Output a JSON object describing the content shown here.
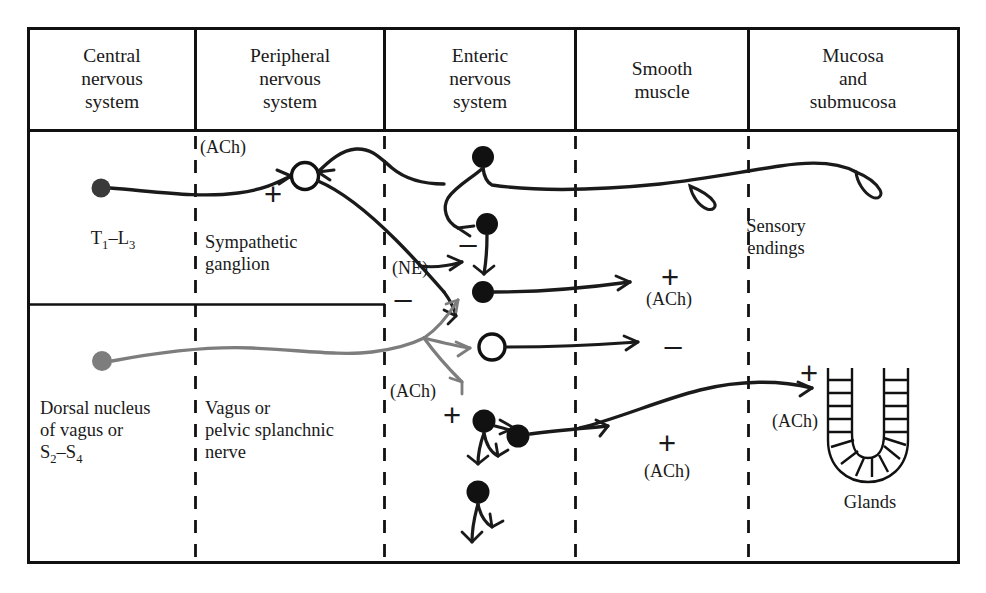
{
  "figure": {
    "type": "physiology-schematic",
    "frame_color": "#111111",
    "sympathetic_color": "#1a1a1a",
    "parasympathetic_color": "#7a7a7a"
  },
  "header": {
    "columns": [
      {
        "label": "Central\nnervous\nsystem",
        "lines": [
          "Central",
          "nervous",
          "system"
        ]
      },
      {
        "label": "Peripheral\nnervous\nsystem",
        "lines": [
          "Peripheral",
          "nervous",
          "system"
        ]
      },
      {
        "label": "Enteric\nnervous\nsystem",
        "lines": [
          "Enteric",
          "nervous",
          "system"
        ]
      },
      {
        "label": "Smooth\nmuscle",
        "lines": [
          "Smooth",
          "muscle"
        ]
      },
      {
        "label": "Mucosa\nand\nsubmucosa",
        "lines": [
          "Mucosa",
          "and",
          "submucosa"
        ]
      }
    ]
  },
  "labels": {
    "cns_sympathetic_line1": "T",
    "cns_sympathetic_sub1": "1",
    "cns_sympathetic_dash": "–L",
    "cns_sympathetic_sub2": "3",
    "sympathetic_ganglion": "Sympathetic\nganglion",
    "sympathetic_ganglion_l1": "Sympathetic",
    "sympathetic_ganglion_l2": "ganglion",
    "cns_parasympathetic_l1": "Dorsal nucleus",
    "cns_parasympathetic_l2": "of vagus or",
    "cns_parasympathetic_l3_a": "S",
    "cns_parasympathetic_l3_sub1": "2",
    "cns_parasympathetic_l3_b": "–S",
    "cns_parasympathetic_l3_sub2": "4",
    "pns_parasympathetic_l1": "Vagus or",
    "pns_parasympathetic_l2": "pelvic splanchnic",
    "pns_parasympathetic_l3": "nerve",
    "sensory_endings_l1": "Sensory",
    "sensory_endings_l2": "endings",
    "glands": "Glands"
  },
  "neurotransmitters": {
    "preganglionic_sympathetic": "(ACh)",
    "postganglionic_sympathetic": "(NE)",
    "preganglionic_parasympathetic": "(ACh)",
    "enteric_to_muscle": "(ACh)",
    "enteric_to_muscle_2": "(ACh)",
    "enteric_to_glands": "(ACh)"
  },
  "signs": {
    "ganglion_excitatory": "+",
    "ne_inhibitory_1": "–",
    "ne_inhibitory_2": "–",
    "ach_excitatory_upper": "+",
    "inhibitory_motor_neuron": "–",
    "vagal_excitatory": "+",
    "ach_excitatory_muscle": "+",
    "ach_excitatory_glands": "+"
  },
  "elements": {
    "filled_soma": "filled-cell-body",
    "open_soma": "open-cell-body",
    "gray_soma": "gray-cell-body",
    "gland_icon": "gland-acinus-icon",
    "sensory_terminal": "sensory-ending-loop"
  }
}
